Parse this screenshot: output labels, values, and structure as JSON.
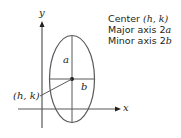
{
  "diagram": {
    "axes": {
      "x_label": "x",
      "y_label": "y"
    },
    "labels": {
      "center_point": "(h, k)",
      "semi_major": "a",
      "semi_minor": "b"
    },
    "legend": [
      {
        "prefix": "Center ",
        "math": "(h, k)"
      },
      {
        "prefix": "Major axis 2",
        "math": "a"
      },
      {
        "prefix": "Minor axis 2",
        "math": "b"
      }
    ],
    "colors": {
      "stroke": "#58595b",
      "text": "#231f20"
    }
  }
}
